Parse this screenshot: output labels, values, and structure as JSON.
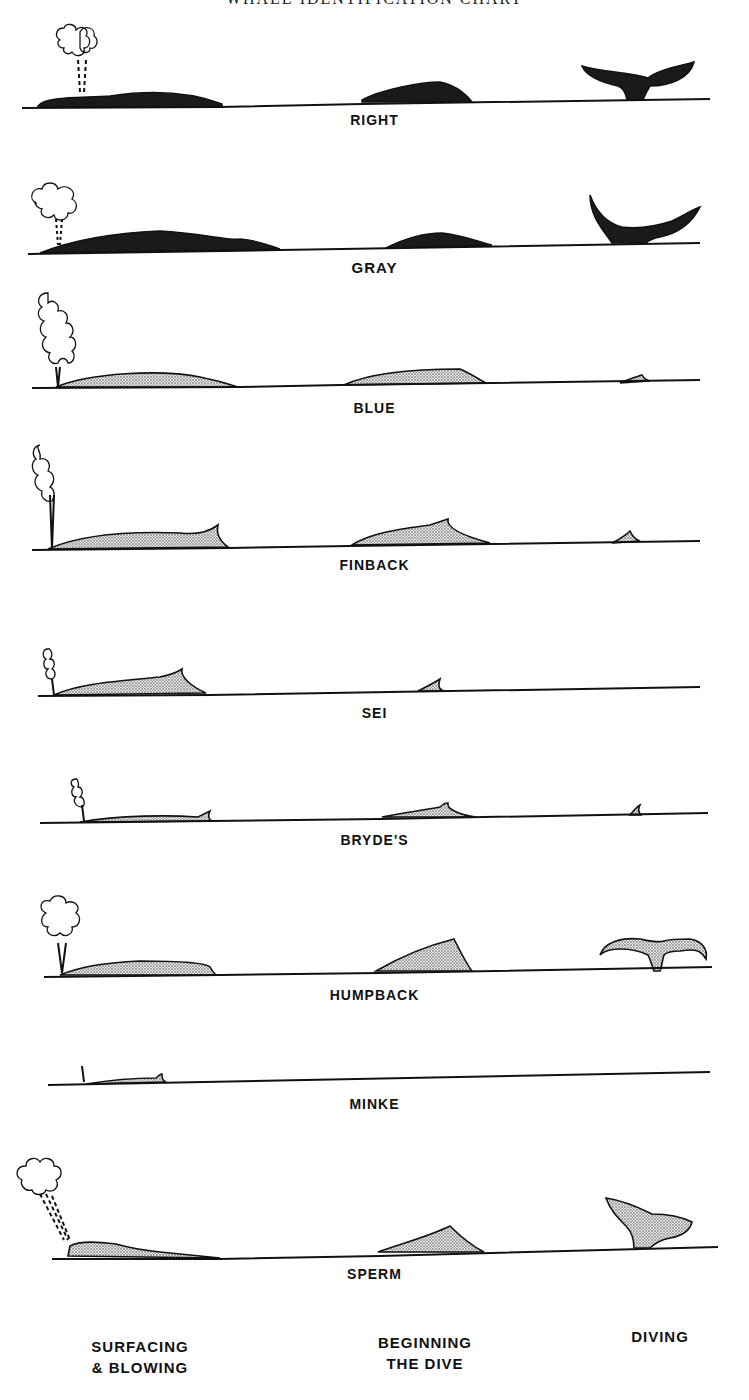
{
  "title": "WHALE IDENTIFICATION CHART",
  "whales": [
    {
      "name": "RIGHT"
    },
    {
      "name": "GRAY"
    },
    {
      "name": "BLUE"
    },
    {
      "name": "FINBACK"
    },
    {
      "name": "SEI"
    },
    {
      "name": "BRYDE'S"
    },
    {
      "name": "HUMPBACK"
    },
    {
      "name": "MINKE"
    },
    {
      "name": "SPERM"
    }
  ],
  "phases": {
    "surfacing": {
      "line1": "SURFACING",
      "line2": "& BLOWING"
    },
    "beginning": {
      "line1": "BEGINNING",
      "line2": "THE DIVE"
    },
    "diving": {
      "line1": "DIVING"
    }
  },
  "colors": {
    "ink": "#111111",
    "background": "#ffffff",
    "stipple": "#bdbdbd"
  }
}
